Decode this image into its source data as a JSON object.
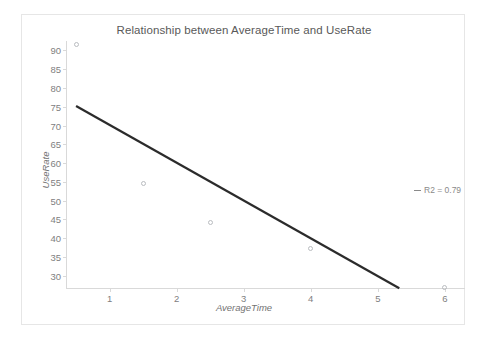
{
  "top_sliver": {
    "fragments": [
      "",
      "",
      ""
    ]
  },
  "chart_data": {
    "type": "scatter",
    "title": "Relationship between AverageTime and UseRate",
    "xlabel": "AverageTime",
    "ylabel": "UseRate",
    "grid": false,
    "xlim": [
      0.35,
      6.3
    ],
    "ylim": [
      26.5,
      92.5
    ],
    "xticks": [
      "1",
      "2",
      "3",
      "4",
      "5",
      "6"
    ],
    "xtick_values": [
      1,
      2,
      3,
      4,
      5,
      6
    ],
    "yticks": [
      "30",
      "35",
      "40",
      "45",
      "50",
      "55",
      "60",
      "65",
      "70",
      "75",
      "80",
      "85",
      "90"
    ],
    "ytick_values": [
      30,
      35,
      40,
      45,
      50,
      55,
      60,
      65,
      70,
      75,
      80,
      85,
      90
    ],
    "points": [
      {
        "x": 0.5,
        "y": 91.5
      },
      {
        "x": 1.5,
        "y": 54.5
      },
      {
        "x": 2.5,
        "y": 44.3
      },
      {
        "x": 4.0,
        "y": 37.2
      },
      {
        "x": 6.0,
        "y": 26.8
      }
    ],
    "trendline": {
      "x_start": 0.5,
      "y_start": 75.2,
      "x_end": 5.32,
      "y_end": 26.7,
      "color": "#2b2b2b"
    },
    "legend": {
      "position": "right",
      "entries": [
        {
          "label": "R2 = 0.79",
          "marker": "line-dash",
          "color": "#8a8a8a"
        }
      ]
    },
    "colors": {
      "marker_stroke": "#b9bcc0",
      "axis": "#d9d9d9",
      "tick_text": "#808080",
      "title_text": "#595959",
      "axis_title_text": "#737373",
      "border": "#e6e6e6",
      "background": "#ffffff"
    }
  }
}
